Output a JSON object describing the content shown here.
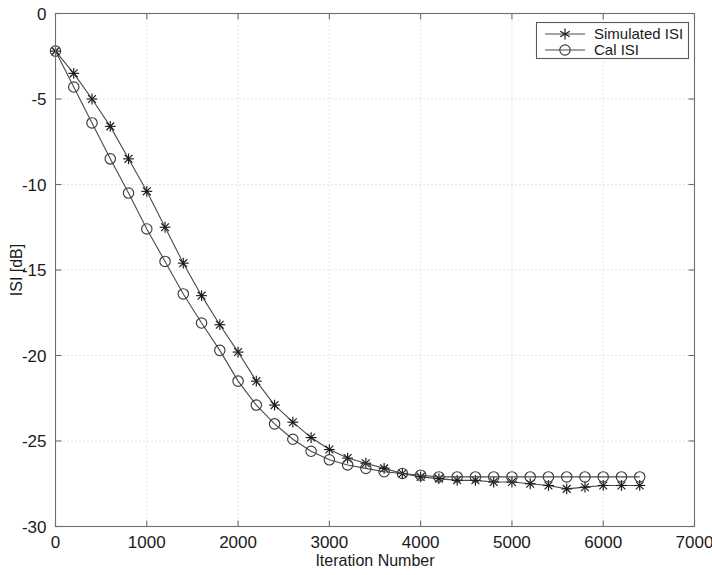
{
  "chart_data": {
    "type": "line",
    "title": "",
    "xlabel": "Iteration Number",
    "ylabel": "ISI [dB]",
    "xlim": [
      0,
      7000
    ],
    "ylim": [
      -30,
      0
    ],
    "xticks": [
      0,
      1000,
      2000,
      3000,
      4000,
      5000,
      6000,
      7000
    ],
    "yticks": [
      0,
      -5,
      -10,
      -15,
      -20,
      -25,
      -30
    ],
    "xtick_labels": [
      "0",
      "1000",
      "2000",
      "3000",
      "4000",
      "5000",
      "6000",
      "7000"
    ],
    "ytick_labels": [
      "0",
      "-5",
      "-10",
      "-15",
      "-20",
      "-25",
      "-30"
    ],
    "grid": true,
    "grid_style": "dotted",
    "legend_position": "top-right",
    "marker_interval": 200,
    "x": [
      0,
      200,
      400,
      600,
      800,
      1000,
      1200,
      1400,
      1600,
      1800,
      2000,
      2200,
      2400,
      2600,
      2800,
      3000,
      3200,
      3400,
      3600,
      3800,
      4000,
      4200,
      4400,
      4600,
      4800,
      5000,
      5200,
      5400,
      5600,
      5800,
      6000,
      6200,
      6400
    ],
    "series": [
      {
        "name": "Simulated ISI",
        "marker": "star",
        "color": "#1a1a1a",
        "values": [
          -2.2,
          -3.5,
          -5.0,
          -6.6,
          -8.5,
          -10.4,
          -12.5,
          -14.6,
          -16.5,
          -18.2,
          -19.8,
          -21.5,
          -22.9,
          -23.9,
          -24.8,
          -25.5,
          -26.0,
          -26.3,
          -26.6,
          -26.9,
          -27.1,
          -27.2,
          -27.3,
          -27.3,
          -27.4,
          -27.4,
          -27.5,
          -27.6,
          -27.8,
          -27.7,
          -27.6,
          -27.6,
          -27.6
        ]
      },
      {
        "name": "Cal ISI",
        "marker": "circle",
        "color": "#3c3c3c",
        "values": [
          -2.2,
          -4.3,
          -6.4,
          -8.5,
          -10.5,
          -12.6,
          -14.5,
          -16.4,
          -18.1,
          -19.7,
          -21.5,
          -22.9,
          -24.0,
          -24.9,
          -25.6,
          -26.1,
          -26.4,
          -26.6,
          -26.8,
          -26.9,
          -27.0,
          -27.1,
          -27.1,
          -27.1,
          -27.1,
          -27.1,
          -27.1,
          -27.1,
          -27.1,
          -27.1,
          -27.1,
          -27.1,
          -27.1
        ]
      }
    ]
  },
  "legend": {
    "entries": [
      {
        "label": "Simulated ISI",
        "marker": "star-marker"
      },
      {
        "label": "Cal ISI",
        "marker": "circle-marker"
      }
    ]
  }
}
